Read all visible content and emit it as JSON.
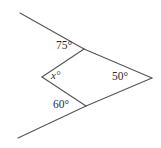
{
  "figure": {
    "name": "angle-diagram",
    "stroke_color": "#555555",
    "text_color": "#2b2b2b",
    "background_color": "#ffffff",
    "stroke_width": 1.1,
    "width": 161,
    "height": 148
  },
  "labels": {
    "top": "75°",
    "left": "x°",
    "right": "50°",
    "bottom": "60°"
  },
  "chart_data": {
    "type": "diagram",
    "title": "",
    "vertices": {
      "top_ray_end": [
        20,
        13
      ],
      "top_vertex": [
        84,
        49
      ],
      "left_vertex": [
        42,
        77
      ],
      "bottom_vertex": [
        86,
        106
      ],
      "bottom_ray_end": [
        18,
        138
      ],
      "right_vertex": [
        152,
        78
      ]
    },
    "segments": [
      {
        "name": "upper-ray",
        "from": [
          20,
          13
        ],
        "to": [
          84,
          49
        ]
      },
      {
        "name": "top-to-left",
        "from": [
          84,
          49
        ],
        "to": [
          42,
          77
        ]
      },
      {
        "name": "left-to-bottom",
        "from": [
          42,
          77
        ],
        "to": [
          86,
          106
        ]
      },
      {
        "name": "bottom-ray",
        "from": [
          86,
          106
        ],
        "to": [
          18,
          138
        ]
      },
      {
        "name": "top-to-right",
        "from": [
          84,
          49
        ],
        "to": [
          152,
          78
        ]
      },
      {
        "name": "right-to-bottom",
        "from": [
          152,
          78
        ],
        "to": [
          86,
          106
        ]
      }
    ],
    "angles": [
      {
        "name": "top-angle",
        "vertex": [
          84,
          49
        ],
        "value": 75,
        "label": "75°"
      },
      {
        "name": "unknown-angle",
        "vertex": [
          42,
          77
        ],
        "value": null,
        "label": "x°"
      },
      {
        "name": "right-angle-50",
        "vertex": [
          152,
          78
        ],
        "value": 50,
        "label": "50°"
      },
      {
        "name": "bottom-angle",
        "vertex": [
          86,
          106
        ],
        "value": 60,
        "label": "60°"
      }
    ]
  }
}
